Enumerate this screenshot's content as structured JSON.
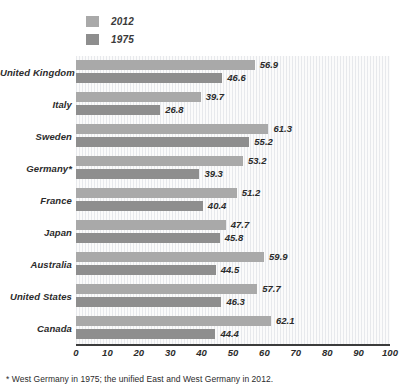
{
  "legend": {
    "position": "top-left",
    "entries": [
      {
        "label": "2012",
        "color": "#a9a9a9",
        "name": "legend-item-2012"
      },
      {
        "label": "1975",
        "color": "#8e8e8e",
        "name": "legend-item-1975"
      }
    ]
  },
  "footnote": "* West Germany in 1975; the unified East and West Germany in 2012.",
  "axis": {
    "ticks": [
      "0",
      "10",
      "20",
      "30",
      "40",
      "50",
      "60",
      "70",
      "80",
      "90",
      "100"
    ]
  },
  "chart_data": {
    "type": "bar",
    "orientation": "horizontal",
    "title": "",
    "subtitle": "",
    "xlabel": "",
    "ylabel": "",
    "xlim": [
      0,
      100
    ],
    "grid": true,
    "legend_position": "top-left",
    "categories": [
      "United Kingdom",
      "Italy",
      "Sweden",
      "Germany*",
      "France",
      "Japan",
      "Australia",
      "United States",
      "Canada"
    ],
    "series": [
      {
        "name": "2012",
        "color": "#a9a9a9",
        "values": [
          56.9,
          39.7,
          61.3,
          53.2,
          51.2,
          47.7,
          59.9,
          57.7,
          62.1
        ]
      },
      {
        "name": "1975",
        "color": "#8e8e8e",
        "values": [
          46.6,
          26.8,
          55.2,
          39.3,
          40.4,
          45.8,
          44.5,
          46.3,
          44.4
        ]
      }
    ]
  }
}
